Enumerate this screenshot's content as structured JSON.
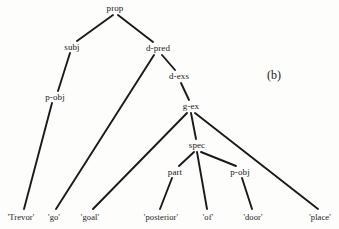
{
  "figure": {
    "panel_label": "(b)",
    "panel_label_pos": {
      "x": 274,
      "y": 75
    },
    "background_color": "#fdfdfc",
    "ink_color": "#1a1a1a",
    "width": 339,
    "height": 229
  },
  "tree": {
    "nodes": [
      {
        "id": "prop",
        "label": "prop",
        "x": 115,
        "y": 8,
        "type": "internal"
      },
      {
        "id": "subj",
        "label": "subj",
        "x": 72,
        "y": 47,
        "type": "internal"
      },
      {
        "id": "d-pred",
        "label": "d-pred",
        "x": 158,
        "y": 48,
        "type": "internal"
      },
      {
        "id": "p-obj-1",
        "label": "p-obj",
        "x": 55,
        "y": 97,
        "type": "internal"
      },
      {
        "id": "d-exs",
        "label": "d-exs",
        "x": 179,
        "y": 76,
        "type": "internal"
      },
      {
        "id": "g-ex",
        "label": "g-ex",
        "x": 191,
        "y": 106,
        "type": "internal"
      },
      {
        "id": "spec",
        "label": "spec",
        "x": 197,
        "y": 145,
        "type": "internal"
      },
      {
        "id": "part",
        "label": "part",
        "x": 175,
        "y": 172,
        "type": "internal"
      },
      {
        "id": "p-obj-2",
        "label": "p-obj",
        "x": 240,
        "y": 172,
        "type": "internal"
      },
      {
        "id": "trevor",
        "label": "'Trevor'",
        "x": 21,
        "y": 217,
        "type": "leaf"
      },
      {
        "id": "go",
        "label": "'go'",
        "x": 54,
        "y": 217,
        "type": "leaf"
      },
      {
        "id": "goal",
        "label": "'goal'",
        "x": 90,
        "y": 217,
        "type": "leaf"
      },
      {
        "id": "posterior",
        "label": "'posterior'",
        "x": 161,
        "y": 217,
        "type": "leaf"
      },
      {
        "id": "of",
        "label": "'of'",
        "x": 208,
        "y": 217,
        "type": "leaf"
      },
      {
        "id": "door",
        "label": "'door'",
        "x": 253,
        "y": 217,
        "type": "leaf"
      },
      {
        "id": "place",
        "label": "'place'",
        "x": 320,
        "y": 217,
        "type": "leaf"
      }
    ],
    "edges": [
      {
        "from": "prop",
        "to": "subj",
        "x1": 113,
        "y1": 15,
        "x2": 77,
        "y2": 41
      },
      {
        "from": "prop",
        "to": "d-pred",
        "x1": 118,
        "y1": 15,
        "x2": 153,
        "y2": 42
      },
      {
        "from": "subj",
        "to": "p-obj-1",
        "x1": 70,
        "y1": 53,
        "x2": 58,
        "y2": 91
      },
      {
        "from": "p-obj-1",
        "to": "trevor",
        "x1": 52,
        "y1": 103,
        "x2": 24,
        "y2": 209
      },
      {
        "from": "d-pred",
        "to": "go",
        "x1": 154,
        "y1": 55,
        "x2": 56,
        "y2": 209
      },
      {
        "from": "d-pred",
        "to": "d-exs",
        "x1": 162,
        "y1": 55,
        "x2": 175,
        "y2": 70
      },
      {
        "from": "d-exs",
        "to": "g-ex",
        "x1": 181,
        "y1": 83,
        "x2": 189,
        "y2": 100
      },
      {
        "from": "g-ex",
        "to": "goal",
        "x1": 187,
        "y1": 113,
        "x2": 93,
        "y2": 209
      },
      {
        "from": "g-ex",
        "to": "spec",
        "x1": 191,
        "y1": 113,
        "x2": 196,
        "y2": 139
      },
      {
        "from": "g-ex",
        "to": "place",
        "x1": 195,
        "y1": 113,
        "x2": 318,
        "y2": 209
      },
      {
        "from": "spec",
        "to": "part",
        "x1": 194,
        "y1": 152,
        "x2": 179,
        "y2": 166
      },
      {
        "from": "spec",
        "to": "of",
        "x1": 197,
        "y1": 152,
        "x2": 207,
        "y2": 209
      },
      {
        "from": "spec",
        "to": "p-obj-2",
        "x1": 201,
        "y1": 152,
        "x2": 236,
        "y2": 166
      },
      {
        "from": "part",
        "to": "posterior",
        "x1": 172,
        "y1": 178,
        "x2": 160,
        "y2": 209
      },
      {
        "from": "p-obj-2",
        "to": "door",
        "x1": 242,
        "y1": 178,
        "x2": 252,
        "y2": 209
      }
    ]
  }
}
